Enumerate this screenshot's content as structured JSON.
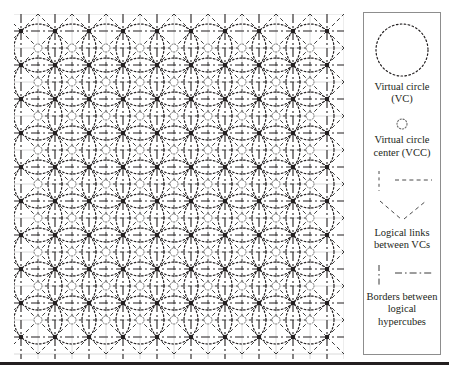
{
  "figure": {
    "type": "virtual-circle-mesh-diagram",
    "background_color": "#ffffff",
    "ink_color": "#231f20",
    "bottom_rule": {
      "y": 362,
      "height": 2.5,
      "color": "#231f20"
    }
  },
  "diagram": {
    "name": "virtual circle lattice",
    "area": {
      "x": 14,
      "y": 14,
      "width": 330,
      "height": 345
    },
    "lattice": {
      "columns": 9,
      "rows": 9,
      "spacing": 34,
      "origin_x": 38,
      "origin_y": 48,
      "circle_radius": 24,
      "vcc_radius": 4
    },
    "styles": {
      "virtual_circle": {
        "dash": "1.6 2.2",
        "width": 1.2,
        "color": "#231f20"
      },
      "logical_link": {
        "dash": "4 3",
        "width": 1,
        "color": "#3a3a3a"
      },
      "hypercube_border": {
        "dash": "9 3 2 3",
        "width": 1.1,
        "color": "#231f20"
      },
      "grid_guide": {
        "width": 0.8,
        "color": "#c9c9c9"
      },
      "node": {
        "radius": 2.2,
        "color": "#231f20"
      }
    }
  },
  "legend": {
    "name": "legend panel",
    "box": {
      "x": 363,
      "y": 12,
      "width": 78,
      "height": 343,
      "border_color": "#8d8d8d"
    },
    "entries": [
      {
        "symbol": "dotted-circle",
        "caption_lines": [
          "Virtual circle",
          "(VC)"
        ],
        "caption": "Virtual circle (VC)"
      },
      {
        "symbol": "small-dotted-circle",
        "caption_lines": [
          "Virtual circle",
          "center (VCC)"
        ],
        "caption": "Virtual circle center (VCC)"
      },
      {
        "symbol": "dashed-lines-vertical-horizontal-and-diagonals",
        "caption_lines": [
          "Logical links",
          "between VCs"
        ],
        "caption": "Logical links between VCs"
      },
      {
        "symbol": "dash-dot-lines-vertical-and-horizontal",
        "caption_lines": [
          "Borders",
          "between",
          "logical",
          "hypercubes"
        ],
        "caption": "Borders between logical hypercubes"
      }
    ]
  }
}
